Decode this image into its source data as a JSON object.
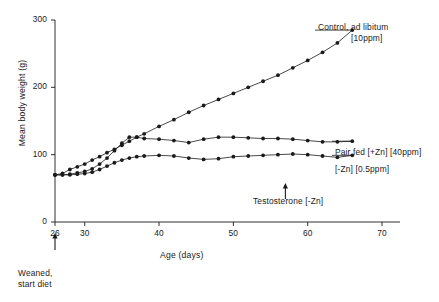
{
  "chart_data": {
    "type": "line",
    "title": "",
    "xlabel": "Age (days)",
    "ylabel": "Mean body weight (g)",
    "xlim": [
      24,
      72
    ],
    "ylim": [
      0,
      310
    ],
    "xticks": [
      26,
      30,
      40,
      50,
      60,
      70
    ],
    "yticks": [
      0,
      100,
      200,
      300
    ],
    "grid": false,
    "legend_position": "inline-right-of-curves",
    "marker": "filled-circle",
    "series": [
      {
        "name": "Control, ad libitum [10ppm]",
        "label_line1": "Control, ad libitum",
        "label_line2": "[10ppm]",
        "x": [
          26,
          27,
          28,
          29,
          30,
          31,
          32,
          33,
          34,
          35,
          36,
          37,
          38,
          40,
          42,
          44,
          46,
          48,
          50,
          52,
          54,
          56,
          58,
          60,
          62,
          64,
          66
        ],
        "y": [
          70,
          72,
          78,
          82,
          86,
          92,
          97,
          103,
          108,
          114,
          120,
          126,
          131,
          142,
          152,
          163,
          173,
          182,
          191,
          200,
          209,
          218,
          229,
          240,
          252,
          266,
          285
        ]
      },
      {
        "name": "Pair fed (+Zn) [40ppm]",
        "label_line1": "Pair  fed [+Zn] [40ppm]",
        "x": [
          26,
          27,
          28,
          29,
          30,
          31,
          32,
          33,
          34,
          35,
          36,
          37,
          38,
          40,
          42,
          44,
          46,
          48,
          50,
          52,
          54,
          56,
          58,
          60,
          62,
          64,
          66
        ],
        "y": [
          70,
          70,
          71,
          73,
          75,
          79,
          86,
          95,
          106,
          117,
          126,
          126,
          124,
          123,
          121,
          118,
          123,
          126,
          126,
          125,
          124,
          124,
          123,
          121,
          119,
          119,
          120
        ]
      },
      {
        "name": "(-Zn) [0.5ppm]",
        "label_line1": "[-Zn] [0.5ppm]",
        "x": [
          26,
          27,
          28,
          29,
          30,
          31,
          32,
          33,
          34,
          35,
          36,
          37,
          38,
          40,
          42,
          44,
          46,
          48,
          50,
          52,
          54,
          56,
          58,
          60,
          62,
          64,
          66
        ],
        "y": [
          70,
          70,
          70,
          71,
          72,
          74,
          78,
          83,
          88,
          92,
          95,
          97,
          98,
          99,
          98,
          95,
          93,
          94,
          97,
          98,
          99,
          100,
          101,
          100,
          98,
          96,
          99
        ]
      }
    ],
    "annotations": [
      {
        "id": "weaned",
        "text_line1": "Weaned,",
        "text_line2": "start diet",
        "at_x": 26,
        "arrow": "up"
      },
      {
        "id": "testosterone",
        "text_line1": "Testosterone [-Zn]",
        "at_x": 57,
        "arrow": "up"
      }
    ]
  },
  "axes": {
    "y_label": "Mean body weight (g)",
    "x_label": "Age (days)",
    "y_tick_labels": [
      "0",
      "100",
      "200",
      "300"
    ],
    "x_tick_labels": [
      "26",
      "30",
      "40",
      "50",
      "60",
      "70"
    ]
  },
  "legend": {
    "control_line1": "Control, ad libitum",
    "control_line2": "[10ppm]",
    "pairfed": "Pair  fed [+Zn] [40ppm]",
    "minuszn": "[-Zn] [0.5ppm]"
  },
  "annotations": {
    "weaned_line1": "Weaned,",
    "weaned_line2": "start diet",
    "testosterone": "Testosterone [-Zn]"
  },
  "colors": {
    "ink": "#1a1a1a",
    "background": "#ffffff"
  }
}
